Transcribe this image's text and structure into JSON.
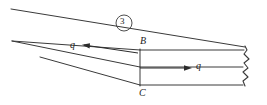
{
  "figure": {
    "title": "",
    "type": "engineering-sketch",
    "line_color": "#3a3a3a",
    "arrow_color": "#2b2b2b",
    "background_color": "#ffffff",
    "labels": {
      "point_b": "B",
      "point_c": "C",
      "shear_flow_left": "q",
      "shear_flow_right": "q",
      "callout_number": "3"
    },
    "annotations": {
      "callout_shape": "circled-number",
      "break_edge": "wavy-break-line",
      "arrow_left_direction": "left",
      "arrow_right_direction": "right"
    }
  }
}
